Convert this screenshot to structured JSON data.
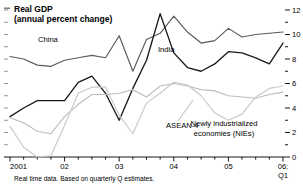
{
  "title_lines": [
    "Real GDP",
    "(annual percent change)"
  ],
  "caption": "Real time data. Based on quarterly Q estimates.",
  "axis": {
    "y_ticks": [
      "0",
      "2",
      "4",
      "6",
      "8",
      "10",
      "12"
    ],
    "y_min": 0,
    "y_max": 12,
    "y_minor_step": 1,
    "y_side": "right",
    "x_ticks": [
      "2001",
      "02",
      "03",
      "04",
      "05",
      "06:"
    ],
    "x_last_sub": "Q1",
    "x_min": "2001Q1",
    "x_max": "2006Q1",
    "grid": false
  },
  "labels": {
    "china": "China",
    "india": "India",
    "asean": "ASEAN-4",
    "nies_line1": "Newly industrialized",
    "nies_line2": "economies (NIEs)"
  },
  "colors": {
    "china": "#5a5a5a",
    "india": "#1a1a1a",
    "asean": "#bdbdbd",
    "nies": "#c9c9c9",
    "axis": "#000000",
    "background": "#ffffff"
  },
  "chart_data": {
    "type": "line",
    "title": "Real GDP",
    "subtitle": "(annual percent change)",
    "xlabel": "",
    "ylabel": "annual percent change",
    "ylim": [
      0,
      12
    ],
    "xlim": [
      "2001Q1",
      "2006Q1"
    ],
    "grid": false,
    "legend": "inline-annotations",
    "x": [
      "2001Q1",
      "2001Q2",
      "2001Q3",
      "2001Q4",
      "2002Q1",
      "2002Q2",
      "2002Q3",
      "2002Q4",
      "2003Q1",
      "2003Q2",
      "2003Q3",
      "2003Q4",
      "2004Q1",
      "2004Q2",
      "2004Q3",
      "2004Q4",
      "2005Q1",
      "2005Q2",
      "2005Q3",
      "2005Q4",
      "2006Q1"
    ],
    "series": [
      {
        "name": "China",
        "color": "#5a5a5a",
        "values": [
          8.2,
          8.0,
          7.5,
          7.4,
          7.9,
          8.1,
          8.3,
          8.1,
          9.9,
          7.0,
          9.6,
          10.1,
          11.5,
          10.2,
          9.3,
          9.5,
          10.5,
          9.8,
          10.0,
          10.1,
          10.2
        ]
      },
      {
        "name": "India",
        "color": "#1a1a1a",
        "values": [
          3.3,
          4.0,
          4.6,
          4.6,
          4.6,
          6.1,
          6.6,
          5.2,
          3.0,
          5.6,
          7.9,
          11.7,
          8.5,
          7.3,
          7.0,
          7.6,
          8.6,
          8.5,
          8.1,
          7.6,
          9.3
        ]
      },
      {
        "name": "ASEAN-4",
        "color": "#bdbdbd",
        "values": [
          3.2,
          2.8,
          2.1,
          1.9,
          3.3,
          4.3,
          5.1,
          5.1,
          5.2,
          5.5,
          4.9,
          5.8,
          6.0,
          5.8,
          5.5,
          5.4,
          5.0,
          4.9,
          4.8,
          5.1,
          5.3
        ]
      },
      {
        "name": "Newly industrialized economies (NIEs)",
        "color": "#c9c9c9",
        "values": [
          2.5,
          0.8,
          0.0,
          0.1,
          2.6,
          5.2,
          5.7,
          5.7,
          3.4,
          1.9,
          4.4,
          5.2,
          6.1,
          5.9,
          5.0,
          3.6,
          3.0,
          3.5,
          4.9,
          5.6,
          5.8
        ]
      }
    ]
  }
}
